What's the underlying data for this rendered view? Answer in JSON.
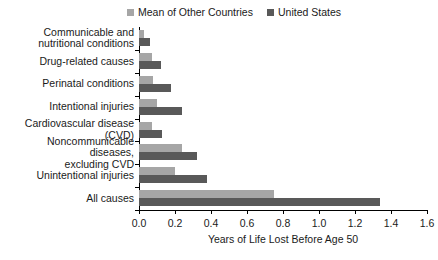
{
  "chart_data": {
    "type": "bar",
    "orientation": "horizontal",
    "title": "",
    "xlabel": "Years of Life Lost Before Age 50",
    "ylabel": "",
    "xlim": [
      0.0,
      1.6
    ],
    "xticks": [
      "0.0",
      "0.2",
      "0.4",
      "0.6",
      "0.8",
      "1.0",
      "1.2",
      "1.4",
      "1.6"
    ],
    "xtick_values": [
      0.0,
      0.2,
      0.4,
      0.6,
      0.8,
      1.0,
      1.2,
      1.4,
      1.6
    ],
    "grid": false,
    "legend_position": "top-center",
    "categories": [
      "Communicable and nutritional conditions",
      "Drug-related causes",
      "Perinatal conditions",
      "Intentional injuries",
      "Cardiovascular disease (CVD)",
      "Noncommunicable diseases, excluding CVD",
      "Unintentional injuries",
      "All causes"
    ],
    "category_lines": [
      [
        "Communicable and",
        "nutritional conditions"
      ],
      [
        "Drug-related causes"
      ],
      [
        "Perinatal conditions"
      ],
      [
        "Intentional injuries"
      ],
      [
        "Cardiovascular disease (CVD)"
      ],
      [
        "Noncommunicable diseases,",
        "excluding CVD"
      ],
      [
        "Unintentional injuries"
      ],
      [
        "All causes"
      ]
    ],
    "series": [
      {
        "name": "Mean of Other Countries",
        "color": "#a6a6a6",
        "values": [
          0.03,
          0.07,
          0.08,
          0.1,
          0.07,
          0.24,
          0.2,
          0.75
        ]
      },
      {
        "name": "United States",
        "color": "#595959",
        "values": [
          0.06,
          0.12,
          0.18,
          0.24,
          0.13,
          0.32,
          0.38,
          1.34
        ]
      }
    ]
  },
  "legend": {
    "items": [
      {
        "label": "Mean of Other Countries",
        "color": "#a6a6a6"
      },
      {
        "label": "United States",
        "color": "#595959"
      }
    ]
  }
}
